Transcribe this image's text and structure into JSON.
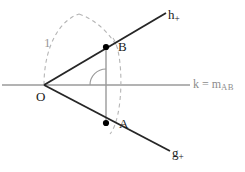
{
  "figure": {
    "background": "#ffffff",
    "width": 245,
    "height": 172,
    "colors": {
      "ray": "#262626",
      "axis": "#9a9a9a",
      "dashed": "#b0b0b0",
      "segment": "#9a9a9a",
      "point": "#000000",
      "label": "#1a1a1a",
      "label_gray": "#8c8c8c"
    },
    "labels": {
      "ray_upper": {
        "base": "h",
        "sub": "+"
      },
      "ray_lower": {
        "base": "g",
        "sub": "+"
      },
      "axis_line": {
        "base": "k = m",
        "sub": "AB"
      },
      "point_b": "B",
      "point_a": "A",
      "vertex": "O",
      "radius": "1"
    },
    "geometry": {
      "vertex": {
        "x": 44,
        "y": 85
      },
      "point_b": {
        "x": 106,
        "y": 47
      },
      "point_a": {
        "x": 106,
        "y": 123
      },
      "ray_upper_end": {
        "x": 166,
        "y": 13
      },
      "ray_lower_end": {
        "x": 170,
        "y": 151
      },
      "axis_start": {
        "x": 2,
        "y": 85
      },
      "axis_end": {
        "x": 190,
        "y": 85
      },
      "radius_arc_label_value": "1",
      "right_angle_marked": true
    }
  }
}
